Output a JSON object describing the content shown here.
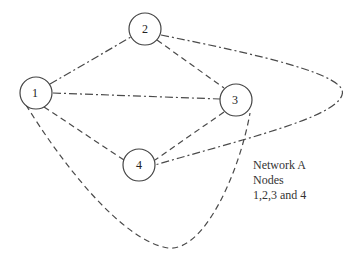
{
  "diagram": {
    "title": "Network A",
    "caption": {
      "line1": "Network A",
      "line2": "Nodes",
      "line3": "1,2,3 and 4"
    },
    "nodes": [
      {
        "id": "1",
        "label": "1",
        "cx": 36,
        "cy": 93
      },
      {
        "id": "2",
        "label": "2",
        "cx": 145,
        "cy": 29
      },
      {
        "id": "3",
        "label": "3",
        "cx": 236,
        "cy": 100
      },
      {
        "id": "4",
        "label": "4",
        "cx": 139,
        "cy": 165
      }
    ],
    "edges": [
      {
        "from": "1",
        "to": "2",
        "style": "dash-dot"
      },
      {
        "from": "1",
        "to": "3",
        "style": "dash-dot"
      },
      {
        "from": "1",
        "to": "4",
        "style": "dashed"
      },
      {
        "from": "2",
        "to": "3",
        "style": "dashed"
      },
      {
        "from": "3",
        "to": "4",
        "style": "dashed"
      },
      {
        "from": "2",
        "to": "4",
        "style": "dash-dot",
        "shape": "loop-right"
      },
      {
        "from": "1",
        "to": "3",
        "style": "dashed",
        "shape": "curve-bottom"
      }
    ],
    "colors": {
      "line": "#4a4a4a",
      "node_stroke": "#444444",
      "text": "#333333",
      "background": "#ffffff"
    }
  }
}
